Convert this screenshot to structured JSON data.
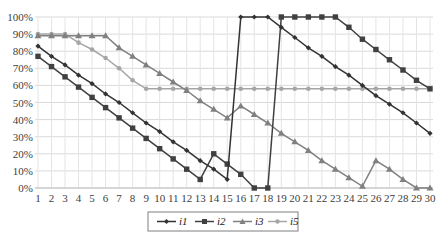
{
  "chart_data": {
    "type": "line",
    "title": "",
    "xlabel": "",
    "ylabel": "",
    "x": [
      1,
      2,
      3,
      4,
      5,
      6,
      7,
      8,
      9,
      10,
      11,
      12,
      13,
      14,
      15,
      16,
      17,
      18,
      19,
      20,
      21,
      22,
      23,
      24,
      25,
      26,
      27,
      28,
      29,
      30
    ],
    "y_ticks": [
      "0%",
      "10%",
      "20%",
      "30%",
      "40%",
      "50%",
      "60%",
      "70%",
      "80%",
      "90%",
      "100%"
    ],
    "ylim": [
      0,
      100
    ],
    "grid": true,
    "legend_position": "bottom",
    "series": [
      {
        "name": "i1",
        "marker": "diamond",
        "color": "#333333",
        "values": [
          83,
          77,
          72,
          66,
          61,
          55,
          50,
          44,
          38,
          33,
          27,
          22,
          16,
          11,
          5,
          100,
          100,
          100,
          94,
          88,
          82,
          77,
          71,
          66,
          60,
          54,
          49,
          44,
          38,
          32
        ]
      },
      {
        "name": "i2",
        "marker": "square",
        "color": "#404040",
        "values": [
          77,
          71,
          65,
          59,
          53,
          47,
          41,
          35,
          29,
          23,
          17,
          11,
          5,
          20,
          14,
          8,
          0,
          0,
          100,
          100,
          100,
          100,
          100,
          94,
          87,
          81,
          75,
          69,
          63,
          58
        ]
      },
      {
        "name": "i3",
        "marker": "triangle",
        "color": "#808080",
        "values": [
          89,
          89,
          89,
          89,
          89,
          89,
          82,
          77,
          72,
          67,
          62,
          57,
          51,
          46,
          41,
          48,
          43,
          38,
          32,
          27,
          22,
          16,
          11,
          6,
          1,
          16,
          11,
          5,
          0,
          0
        ]
      },
      {
        "name": "i5",
        "marker": "circle",
        "color": "#a6a6a6",
        "values": [
          90,
          90,
          90,
          85,
          81,
          76,
          70,
          63,
          58,
          58,
          58,
          58,
          58,
          58,
          58,
          58,
          58,
          58,
          58,
          58,
          58,
          58,
          58,
          58,
          58,
          58,
          58,
          58,
          58,
          58
        ]
      }
    ]
  },
  "legend": {
    "items": [
      {
        "label": "i1"
      },
      {
        "label": "i2"
      },
      {
        "label": "i3"
      },
      {
        "label": "i5"
      }
    ]
  }
}
